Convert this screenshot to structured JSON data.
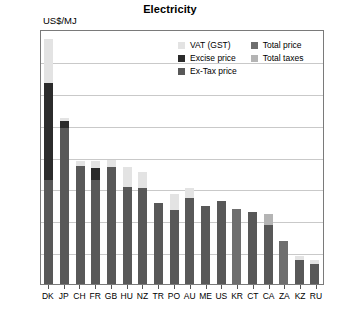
{
  "chart_data": {
    "type": "bar",
    "title": "Electricity",
    "subtitle": "",
    "ylabel": "US$/MJ",
    "xlabel": "",
    "ylim": [
      0.0,
      0.08
    ],
    "ytick_labels": [
      "0.08",
      "0.07",
      "0.06",
      "0.05",
      "0.04",
      "0.03",
      "0.02",
      "0.01",
      "0.00"
    ],
    "ytick_values": [
      0.08,
      0.07,
      0.06,
      0.05,
      0.04,
      0.03,
      0.02,
      0.01,
      0.0
    ],
    "grid": true,
    "stacked": true,
    "legend_position": "top-right",
    "legend": [
      {
        "label": "VAT (GST)",
        "color": "#e3e3e3",
        "key": "vat"
      },
      {
        "label": "Excise price",
        "color": "#2b2b2b",
        "key": "excise"
      },
      {
        "label": "Ex-Tax price",
        "color": "#585858",
        "key": "extax"
      },
      {
        "label": "Total price",
        "color": "#6e6e6e",
        "key": "total"
      },
      {
        "label": "Total taxes",
        "color": "#b4b4b4",
        "key": "taxes"
      }
    ],
    "categories": [
      "DK",
      "JP",
      "CH",
      "FR",
      "GB",
      "HU",
      "NZ",
      "TR",
      "PO",
      "AU",
      "ME",
      "US",
      "KR",
      "CT",
      "CA",
      "ZA",
      "KZ",
      "RU"
    ],
    "series": [
      {
        "name": "Ex-Tax price",
        "key": "extax",
        "values": [
          0.0325,
          0.049,
          0.037,
          0.0325,
          0.0368,
          0.0305,
          0.03,
          0.0255,
          0.0232,
          0.027,
          0.0245,
          0.0262,
          0.0,
          0.0225,
          0.0185,
          0.0,
          0.0075,
          0.0063
        ]
      },
      {
        "name": "Excise price",
        "key": "excise",
        "values": [
          0.0305,
          0.0022,
          0.0,
          0.004,
          0.0,
          0.0,
          0.0,
          0.0,
          0.0,
          0.0,
          0.0,
          0.0,
          0.0,
          0.0,
          0.0,
          0.0,
          0.0,
          0.0
        ]
      },
      {
        "name": "VAT (GST)",
        "key": "vat",
        "values": [
          0.014,
          0.001,
          0.0015,
          0.002,
          0.002,
          0.0063,
          0.005,
          0.0,
          0.005,
          0.0032,
          0.0,
          0.0,
          0.0,
          0.0,
          0.0035,
          0.0,
          0.0012,
          0.0013
        ]
      },
      {
        "name": "Total price",
        "key": "total",
        "values": [
          0.0,
          0.0,
          0.0,
          0.0,
          0.0,
          0.0,
          0.0,
          0.0,
          0.0,
          0.0,
          0.0,
          0.0,
          0.0235,
          0.0,
          0.0,
          0.0135,
          0.0,
          0.0
        ]
      }
    ],
    "totals": [
      0.077,
      0.0522,
      0.0385,
      0.0385,
      0.0388,
      0.0368,
      0.035,
      0.0255,
      0.0282,
      0.0302,
      0.0245,
      0.0262,
      0.0235,
      0.0225,
      0.022,
      0.0135,
      0.0087,
      0.0076
    ],
    "bars": [
      {
        "cat": "DK",
        "segments": [
          {
            "key": "extax",
            "v": 0.0325
          },
          {
            "key": "excise",
            "v": 0.0305
          },
          {
            "key": "vat",
            "v": 0.014
          }
        ]
      },
      {
        "cat": "JP",
        "segments": [
          {
            "key": "extax",
            "v": 0.049
          },
          {
            "key": "excise",
            "v": 0.0022
          },
          {
            "key": "vat",
            "v": 0.001
          }
        ]
      },
      {
        "cat": "CH",
        "segments": [
          {
            "key": "extax",
            "v": 0.037
          },
          {
            "key": "vat",
            "v": 0.0015
          }
        ]
      },
      {
        "cat": "FR",
        "segments": [
          {
            "key": "extax",
            "v": 0.0325
          },
          {
            "key": "excise",
            "v": 0.004
          },
          {
            "key": "vat",
            "v": 0.002
          }
        ]
      },
      {
        "cat": "GB",
        "segments": [
          {
            "key": "extax",
            "v": 0.0368
          },
          {
            "key": "vat",
            "v": 0.002
          }
        ]
      },
      {
        "cat": "HU",
        "segments": [
          {
            "key": "extax",
            "v": 0.0305
          },
          {
            "key": "vat",
            "v": 0.0063
          }
        ]
      },
      {
        "cat": "NZ",
        "segments": [
          {
            "key": "extax",
            "v": 0.03
          },
          {
            "key": "vat",
            "v": 0.005
          }
        ]
      },
      {
        "cat": "TR",
        "segments": [
          {
            "key": "extax",
            "v": 0.0255
          }
        ]
      },
      {
        "cat": "PO",
        "segments": [
          {
            "key": "extax",
            "v": 0.0232
          },
          {
            "key": "vat",
            "v": 0.005
          }
        ]
      },
      {
        "cat": "AU",
        "segments": [
          {
            "key": "extax",
            "v": 0.027
          },
          {
            "key": "vat",
            "v": 0.0032
          }
        ]
      },
      {
        "cat": "ME",
        "segments": [
          {
            "key": "extax",
            "v": 0.0245
          }
        ]
      },
      {
        "cat": "US",
        "segments": [
          {
            "key": "extax",
            "v": 0.0262
          }
        ]
      },
      {
        "cat": "KR",
        "segments": [
          {
            "key": "total",
            "v": 0.0235
          }
        ]
      },
      {
        "cat": "CT",
        "segments": [
          {
            "key": "extax",
            "v": 0.0225
          }
        ]
      },
      {
        "cat": "CA",
        "segments": [
          {
            "key": "extax",
            "v": 0.0185
          },
          {
            "key": "taxes",
            "v": 0.0035
          }
        ]
      },
      {
        "cat": "ZA",
        "segments": [
          {
            "key": "total",
            "v": 0.0135
          }
        ]
      },
      {
        "cat": "KZ",
        "segments": [
          {
            "key": "extax",
            "v": 0.0075
          },
          {
            "key": "vat",
            "v": 0.0012
          }
        ]
      },
      {
        "cat": "RU",
        "segments": [
          {
            "key": "extax",
            "v": 0.0063
          },
          {
            "key": "vat",
            "v": 0.0013
          }
        ]
      }
    ]
  }
}
